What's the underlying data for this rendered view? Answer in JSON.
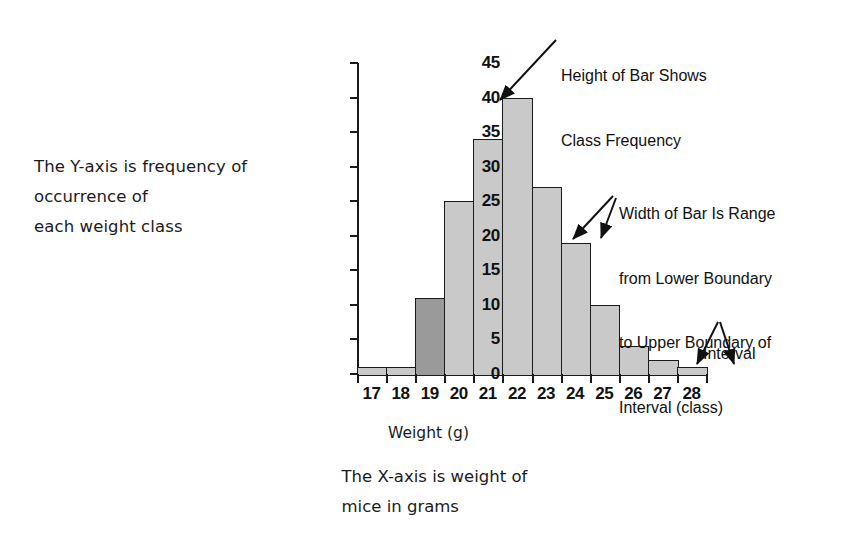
{
  "figure": {
    "left_note_lines": [
      "The Y-axis is frequency of",
      "occurrence of",
      "each weight class"
    ],
    "bottom_note_lines": [
      "The X-axis is weight of",
      "mice in grams"
    ],
    "annotations": {
      "height_of_bar": [
        "Height of Bar Shows",
        "Class Frequency"
      ],
      "width_of_bar": [
        "Width of Bar Is Range",
        "from Lower Boundary",
        "to Upper Boundary of",
        "Interval (class)"
      ],
      "interval": [
        "Interval"
      ]
    },
    "colors": {
      "bar_fill": "#c9c9c9",
      "bar_highlight_fill": "#9a9a9a",
      "bar_stroke": "#1a1a1a",
      "text": "#1b1b1b"
    }
  },
  "chart_data": {
    "type": "bar",
    "title": "",
    "xlabel": "Weight (g)",
    "ylabel": "",
    "categories": [
      "17",
      "18",
      "19",
      "20",
      "21",
      "22",
      "23",
      "24",
      "25",
      "26",
      "27",
      "28"
    ],
    "values": [
      1,
      1,
      11,
      25,
      34,
      40,
      27,
      19,
      10,
      4,
      2,
      1
    ],
    "highlighted_category": "19",
    "xlim": [
      16.5,
      28.5
    ],
    "ylim": [
      0,
      45
    ],
    "yticks": [
      0,
      5,
      10,
      15,
      20,
      25,
      30,
      35,
      40,
      45
    ],
    "xticks": [
      "16.5",
      "17.5",
      "18.5",
      "19.5",
      "20.5",
      "21.5",
      "22.5",
      "23.5",
      "24.5",
      "25.5",
      "26.5",
      "27.5",
      "28.5"
    ],
    "grid": false,
    "legend": false
  }
}
